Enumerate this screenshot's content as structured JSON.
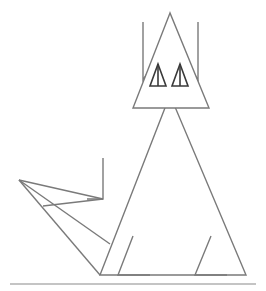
{
  "figure": {
    "colors": {
      "background": "#ffffff",
      "line": "#7a7a7a",
      "eye_line": "#3a3a3a",
      "ground": "#8a8a8a"
    },
    "shapes": {
      "head": "170,13 133,108 209,108",
      "ear_left": "143,22 143,80 156,60",
      "ear_right": "198,22 198,80 185,60",
      "eye_left": "158,64 150,86 166,86",
      "eye_left_mid": "158,64 158,86",
      "eye_right": "180,64 172,86 188,86",
      "eye_right_mid": "180,64 180,86",
      "body": "170,95 100,275 246,275",
      "foot_left": "133,236 118,275 150,275",
      "foot_right": "211,236 195,275 227,275",
      "tail_top": "103,158 103,199 87,199",
      "tail_upper": "19,180 103,199",
      "tail_cross": "43,206 103,199",
      "tail_mid": "19,180 110,244",
      "tail_low": "19,180 100,275",
      "ground": "10,284 256,284"
    }
  }
}
